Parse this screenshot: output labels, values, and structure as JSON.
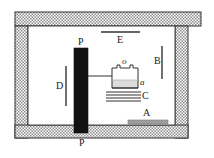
{
  "figure": {
    "type": "apparatus-diagram",
    "background_color": "#ffffff",
    "line_color": "#1a1a1a",
    "hatch_color": "#8c8c8c",
    "plate_color": "#111111",
    "liquid_color": "#d9d9d9",
    "bar_color": "#a0a0a0"
  },
  "labels": {
    "p_top": "P",
    "p_bottom": "P",
    "e": "E",
    "b": "B",
    "d": "D",
    "c": "C",
    "a": "a",
    "o": "o",
    "a_upper": "A"
  },
  "parts": [
    {
      "id": "p_top",
      "label": "P",
      "name": "black-plate-label-top"
    },
    {
      "id": "e",
      "label": "E",
      "name": "upper-horizontal-bar-label"
    },
    {
      "id": "b",
      "label": "B",
      "name": "right-vertical-bar-label"
    },
    {
      "id": "d",
      "label": "D",
      "name": "left-vertical-bar-label"
    },
    {
      "id": "o",
      "label": "o",
      "name": "vessel-neck-label"
    },
    {
      "id": "a",
      "label": "a",
      "name": "liquid-level-label"
    },
    {
      "id": "c",
      "label": "C",
      "name": "plate-stack-label"
    },
    {
      "id": "a_upper",
      "label": "A",
      "name": "bottom-bar-label"
    },
    {
      "id": "p_bottom",
      "label": "P",
      "name": "base-wall-label"
    }
  ]
}
